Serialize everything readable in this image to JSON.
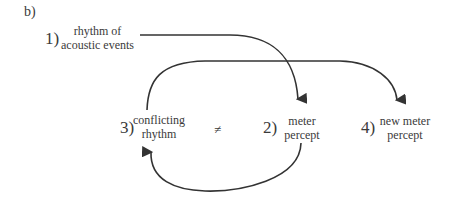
{
  "panel_label": "b)",
  "nodes": [
    {
      "number": "1)",
      "line1": "rhythm of",
      "line2": "acoustic events"
    },
    {
      "number": "2)",
      "line1": "meter",
      "line2": "percept"
    },
    {
      "number": "3)",
      "line1": "conflicting",
      "line2": "rhythm"
    },
    {
      "number": "4)",
      "line1": "new meter",
      "line2": "percept"
    }
  ],
  "relation_symbol": "≠",
  "edges": [
    {
      "from": "1",
      "to": "2"
    },
    {
      "from": "2",
      "to": "3"
    },
    {
      "from": "3",
      "to": "4"
    }
  ],
  "colors": {
    "line": "#333333",
    "text": "#3a3a3a"
  }
}
